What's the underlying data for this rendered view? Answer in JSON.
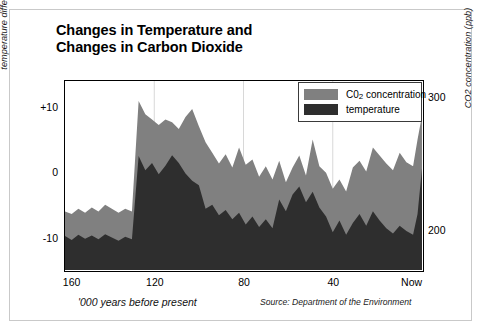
{
  "title": "Changes in Temperature and\nChanges in Carbon Dioxide",
  "axes": {
    "y_left_label": "temperature difference from now (degrees celcius)",
    "y_left_ticks": [
      "+10",
      "0",
      "-10"
    ],
    "y_right_label": "CO2 concentration (ppb)",
    "y_right_ticks": [
      "300",
      "200"
    ],
    "x_label": "'000 years before present",
    "x_ticks": [
      "160",
      "120",
      "80",
      "40",
      "Now"
    ]
  },
  "legend": {
    "items": [
      {
        "label_main": "C0",
        "label_sub": "2",
        "label_tail": " concentration",
        "color": "#808080"
      },
      {
        "label_main": "temperature",
        "label_sub": "",
        "label_tail": "",
        "color": "#2e2e2e"
      }
    ]
  },
  "source": "Source: Department of the Environment",
  "colors": {
    "co2_area": "#808080",
    "temperature_area": "#2e2e2e",
    "frame": "#000000",
    "gridline": "#d8d8d8",
    "outer_border": "#c9c9c9"
  },
  "chart_data": {
    "type": "area",
    "title": "Changes in Temperature and Changes in Carbon Dioxide",
    "xlabel": "'000 years before present",
    "ylabel": "temperature difference from now (degrees celcius)",
    "ylabel_secondary": "CO2 concentration (ppb)",
    "xlim": [
      160,
      0
    ],
    "ylim": [
      -15,
      14
    ],
    "ylim_secondary": [
      170,
      312
    ],
    "x_tick_values": [
      160,
      120,
      80,
      40,
      0
    ],
    "x_tick_labels": [
      "160",
      "120",
      "80",
      "40",
      "Now"
    ],
    "y_tick_values": [
      10,
      0,
      -10
    ],
    "y_tick_labels": [
      "+10",
      "0",
      "-10"
    ],
    "y2_tick_values": [
      300,
      200
    ],
    "y2_tick_labels": [
      "300",
      "200"
    ],
    "grid": "vertical-only",
    "legend_position": "top-right",
    "x": [
      160,
      157,
      154,
      151,
      148,
      145,
      142,
      139,
      136,
      133,
      130,
      127,
      124,
      121,
      118,
      115,
      112,
      109,
      106,
      103,
      100,
      97,
      94,
      91,
      88,
      85,
      82,
      79,
      76,
      73,
      70,
      67,
      64,
      61,
      58,
      55,
      52,
      49,
      46,
      43,
      40,
      37,
      34,
      31,
      28,
      25,
      22,
      19,
      16,
      13,
      10,
      7,
      4,
      2,
      0
    ],
    "series": [
      {
        "name": "C02 concentration",
        "axis": "right",
        "units": "ppb",
        "color": "#808080",
        "values": [
          214,
          212,
          216,
          213,
          217,
          214,
          219,
          216,
          213,
          216,
          214,
          297,
          287,
          283,
          279,
          283,
          281,
          276,
          285,
          291,
          278,
          266,
          258,
          250,
          257,
          247,
          262,
          249,
          253,
          240,
          248,
          238,
          252,
          236,
          247,
          256,
          241,
          268,
          248,
          243,
          231,
          238,
          229,
          247,
          252,
          244,
          262,
          256,
          250,
          245,
          258,
          251,
          248,
          268,
          286
        ]
      },
      {
        "name": "temperature",
        "axis": "left",
        "units": "degrees celcius",
        "color": "#2e2e2e",
        "values": [
          -9.8,
          -10.4,
          -9.6,
          -10.2,
          -9.7,
          -10.3,
          -9.5,
          -10.0,
          -10.5,
          -9.9,
          -10.3,
          2.5,
          0.3,
          1.4,
          -0.3,
          1.0,
          2.6,
          1.4,
          -0.2,
          -1.3,
          -2.0,
          -5.6,
          -5.0,
          -6.6,
          -5.8,
          -7.2,
          -6.2,
          -8.0,
          -6.8,
          -8.4,
          -7.2,
          -8.6,
          -4.2,
          -6.0,
          -3.4,
          -2.2,
          -4.6,
          -3.0,
          -5.4,
          -6.8,
          -9.2,
          -7.4,
          -9.6,
          -7.8,
          -6.4,
          -8.2,
          -6.0,
          -7.4,
          -8.6,
          -9.4,
          -8.2,
          -9.0,
          -9.6,
          -6.4,
          0.6
        ]
      }
    ]
  }
}
